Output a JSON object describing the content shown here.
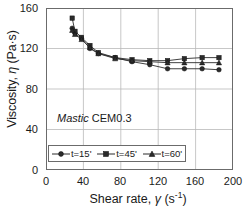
{
  "chart_data": {
    "type": "line",
    "title": "",
    "xlabel": "Shear rate, γ  (s-1)",
    "ylabel": "Viscosity, η (Pa·s)",
    "xlim": [
      0,
      200
    ],
    "ylim": [
      0,
      160
    ],
    "xticks": [
      0,
      40,
      80,
      120,
      160,
      200
    ],
    "yticks": [
      0,
      40,
      80,
      120,
      160
    ],
    "grid": true,
    "legend_position": "inside-lower-left",
    "annotation": "Mastic CEM0.3",
    "annotation_italic_part": "Mastic",
    "annotation_plain_part": "CEM0.3",
    "x": [
      28,
      31,
      38,
      47,
      56,
      74,
      92,
      111,
      130,
      148,
      167,
      185
    ],
    "series": [
      {
        "name": "t=15'",
        "marker": "circle",
        "values": [
          140,
          135,
          130,
          120,
          115,
          111,
          107,
          104,
          100,
          100,
          100,
          99
        ]
      },
      {
        "name": "t=45'",
        "marker": "square",
        "values": [
          150,
          137,
          131,
          123,
          116,
          111,
          109,
          108,
          108,
          110,
          111,
          111
        ]
      },
      {
        "name": "t=60'",
        "marker": "triangle",
        "values": [
          138,
          134,
          129,
          121,
          115,
          110,
          108,
          107,
          106,
          106,
          106,
          106
        ]
      }
    ],
    "colors": {
      "series": "#2b2b2b",
      "grid": "#b9b9b9",
      "axis": "#6b6b6b",
      "text": "#1a1a1a"
    }
  },
  "axes": {
    "y_tick_labels": [
      "160",
      "120",
      "80",
      "40",
      "0"
    ],
    "x_tick_labels": [
      "0",
      "40",
      "80",
      "120",
      "160",
      "200"
    ],
    "y_title_main": "Viscosity, ",
    "y_title_symbol": "η",
    "y_title_unit": " (Pa·s)",
    "x_title_main": "Shear rate, ",
    "x_title_symbol": "γ",
    "x_title_unit_open": "  (s",
    "x_title_unit_exp": "-1",
    "x_title_unit_close": ")"
  },
  "legend": {
    "items": [
      {
        "label": "t=15'",
        "marker": "circle-marker"
      },
      {
        "label": "t=45'",
        "marker": "square-marker"
      },
      {
        "label": "t=60'",
        "marker": "triangle-marker"
      }
    ]
  }
}
